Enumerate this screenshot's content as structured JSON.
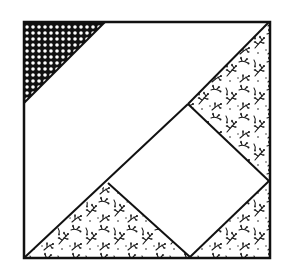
{
  "diagram": {
    "colors": {
      "background": "#ffffff",
      "outline": "#111111",
      "dark_fabric": "#111111",
      "dot": "#ffffff",
      "plain_fabric": "#ffffff",
      "floral_fabric_bg": "#ffffff",
      "floral_fabric_ink": "#1a1a1a"
    },
    "pieces": [
      {
        "id": "dotted-corner-triangle",
        "fabric": "dark-dotted"
      },
      {
        "id": "white-diagonal-band",
        "fabric": "plain-white"
      },
      {
        "id": "white-center-square",
        "fabric": "plain-white"
      },
      {
        "id": "floral-right-triangle",
        "fabric": "floral"
      },
      {
        "id": "floral-bottom-left-triangle",
        "fabric": "floral"
      },
      {
        "id": "floral-bottom-right-triangle",
        "fabric": "floral"
      }
    ]
  }
}
